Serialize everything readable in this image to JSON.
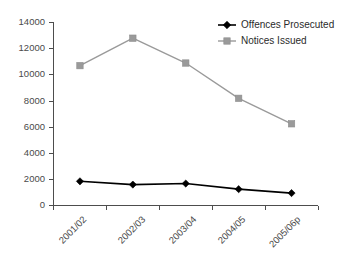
{
  "chart_data": {
    "type": "line",
    "title": "",
    "xlabel": "",
    "ylabel": "",
    "categories": [
      "2001/02",
      "2002/03",
      "2003/04",
      "2004/05",
      "2005/06p"
    ],
    "series": [
      {
        "name": "Offences Prosecuted",
        "color": "#000000",
        "marker": "diamond",
        "values": [
          1850,
          1600,
          1680,
          1250,
          950
        ]
      },
      {
        "name": "Notices Issued",
        "color": "#9a9a9a",
        "marker": "square",
        "values": [
          10700,
          12800,
          10900,
          8200,
          6250
        ]
      }
    ],
    "ylim": [
      0,
      14000
    ],
    "ytick_values": [
      0,
      2000,
      4000,
      6000,
      8000,
      10000,
      12000,
      14000
    ],
    "ytick_labels": [
      "0",
      "2000",
      "4000",
      "6000",
      "8000",
      "10000",
      "12000",
      "14000"
    ],
    "grid": false,
    "legend_position": "top-right"
  },
  "legend": {
    "entries": [
      {
        "label": "Offences Prosecuted"
      },
      {
        "label": "Notices Issued"
      }
    ]
  },
  "axes": {
    "y": {
      "labels": [
        "14000",
        "12000",
        "10000",
        "8000",
        "6000",
        "4000",
        "2000",
        "0"
      ]
    },
    "x": {
      "labels": [
        "2001/02",
        "2002/03",
        "2003/04",
        "2004/05",
        "2005/06p"
      ]
    }
  }
}
